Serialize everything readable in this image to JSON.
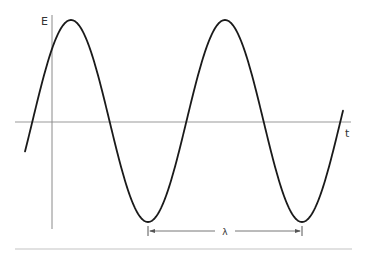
{
  "diagram": {
    "title": "",
    "labels": {
      "y_axis": "E",
      "x_axis": "t",
      "wavelength": "λ"
    },
    "wave": {
      "type": "sine",
      "center_y": 121,
      "amplitude_px": 101,
      "period_px": 154,
      "peak_x": 71,
      "start_x": 25,
      "end_x": 343
    },
    "colors": {
      "curve": "#1a1a1a",
      "axis": "#8a8a8a",
      "annotation": "#555555",
      "rule": "#bdbdbd"
    }
  }
}
